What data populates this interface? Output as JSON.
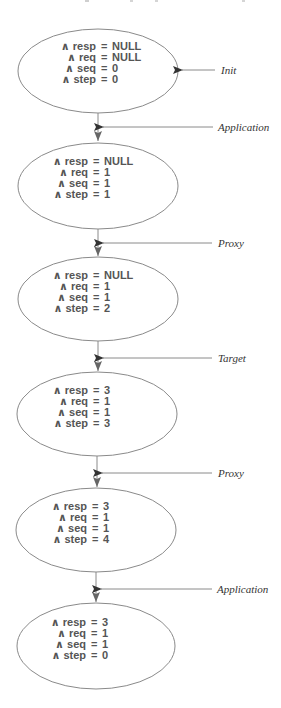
{
  "diagram": {
    "type": "state-transition-trace",
    "colors": {
      "ellipse_stroke": "#8a8a8a",
      "connector": "#8a8a8a",
      "arrowhead": "#333333",
      "state_text": "#555555",
      "label_text": "#333333"
    },
    "states": [
      {
        "vars": [
          {
            "name": "∧ resp",
            "op": "=",
            "value": "NULL"
          },
          {
            "name": "∧ req",
            "op": "=",
            "value": "NULL"
          },
          {
            "name": "∧ seq",
            "op": "=",
            "value": "0"
          },
          {
            "name": "∧ step",
            "op": "=",
            "value": "0"
          }
        ]
      },
      {
        "vars": [
          {
            "name": "∧ resp",
            "op": "=",
            "value": "NULL"
          },
          {
            "name": "∧ req",
            "op": "=",
            "value": "1"
          },
          {
            "name": "∧ seq",
            "op": "=",
            "value": "1"
          },
          {
            "name": "∧ step",
            "op": "=",
            "value": "1"
          }
        ]
      },
      {
        "vars": [
          {
            "name": "∧ resp",
            "op": "=",
            "value": "NULL"
          },
          {
            "name": "∧ req",
            "op": "=",
            "value": "1"
          },
          {
            "name": "∧ seq",
            "op": "=",
            "value": "1"
          },
          {
            "name": "∧ step",
            "op": "=",
            "value": "2"
          }
        ]
      },
      {
        "vars": [
          {
            "name": "∧ resp",
            "op": "=",
            "value": "3"
          },
          {
            "name": "∧ req",
            "op": "=",
            "value": "1"
          },
          {
            "name": "∧ seq",
            "op": "=",
            "value": "1"
          },
          {
            "name": "∧ step",
            "op": "=",
            "value": "3"
          }
        ]
      },
      {
        "vars": [
          {
            "name": "∧ resp",
            "op": "=",
            "value": "3"
          },
          {
            "name": "∧ req",
            "op": "=",
            "value": "1"
          },
          {
            "name": "∧ seq",
            "op": "=",
            "value": "1"
          },
          {
            "name": "∧ step",
            "op": "=",
            "value": "4"
          }
        ]
      },
      {
        "vars": [
          {
            "name": "∧ resp",
            "op": "=",
            "value": "3"
          },
          {
            "name": "∧ req",
            "op": "=",
            "value": "1"
          },
          {
            "name": "∧ seq",
            "op": "=",
            "value": "1"
          },
          {
            "name": "∧ step",
            "op": "=",
            "value": "0"
          }
        ]
      }
    ],
    "init_label": "Init",
    "transitions": [
      {
        "label": "Application"
      },
      {
        "label": "Proxy"
      },
      {
        "label": "Target"
      },
      {
        "label": "Proxy"
      },
      {
        "label": "Application"
      }
    ]
  }
}
